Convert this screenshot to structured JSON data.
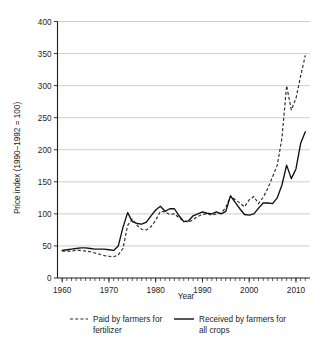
{
  "chart_data": {
    "type": "line",
    "title": "",
    "xlabel": "Year",
    "ylabel": "Price index (1990–1992 = 100)",
    "xlim": [
      1959,
      2013
    ],
    "ylim": [
      0,
      400
    ],
    "xticks": [
      1960,
      1970,
      1980,
      1990,
      2000,
      2010
    ],
    "xtick_labels": [
      "1960",
      "1970",
      "1980",
      "1990",
      "2000",
      "2010"
    ],
    "yticks": [
      0,
      50,
      100,
      150,
      200,
      250,
      300,
      350,
      400
    ],
    "ytick_labels": [
      "0",
      "50",
      "100",
      "150",
      "200",
      "250",
      "300",
      "350",
      "400"
    ],
    "minor_x_tick_interval": 1,
    "grid": "horizontal",
    "legend_position": "below-axes",
    "series": [
      {
        "name": "Paid by farmers for fertilizer",
        "style": "dashed",
        "color": "#2b2b2b",
        "x": [
          1960,
          1961,
          1962,
          1963,
          1964,
          1965,
          1966,
          1967,
          1968,
          1969,
          1970,
          1971,
          1972,
          1973,
          1974,
          1975,
          1976,
          1977,
          1978,
          1979,
          1980,
          1981,
          1982,
          1983,
          1984,
          1985,
          1986,
          1987,
          1988,
          1989,
          1990,
          1991,
          1992,
          1993,
          1994,
          1995,
          1996,
          1997,
          1998,
          1999,
          2000,
          2001,
          2002,
          2003,
          2004,
          2005,
          2006,
          2007,
          2008,
          2009,
          2010,
          2011,
          2012
        ],
        "values": [
          42,
          42,
          42,
          43,
          43,
          42,
          41,
          39,
          37,
          35,
          34,
          33,
          36,
          46,
          82,
          92,
          82,
          76,
          75,
          80,
          90,
          104,
          103,
          99,
          100,
          94,
          89,
          87,
          91,
          96,
          99,
          100,
          98,
          100,
          101,
          110,
          128,
          122,
          117,
          111,
          122,
          127,
          116,
          126,
          140,
          158,
          176,
          218,
          300,
          262,
          280,
          315,
          347
        ]
      },
      {
        "name": "Received by farmers for all crops",
        "style": "solid",
        "color": "#111111",
        "x": [
          1960,
          1961,
          1962,
          1963,
          1964,
          1965,
          1966,
          1967,
          1968,
          1969,
          1970,
          1971,
          1972,
          1973,
          1974,
          1975,
          1976,
          1977,
          1978,
          1979,
          1980,
          1981,
          1982,
          1983,
          1984,
          1985,
          1986,
          1987,
          1988,
          1989,
          1990,
          1991,
          1992,
          1993,
          1994,
          1995,
          1996,
          1997,
          1998,
          1999,
          2000,
          2001,
          2002,
          2003,
          2004,
          2005,
          2006,
          2007,
          2008,
          2009,
          2010,
          2011,
          2012
        ],
        "values": [
          43,
          44,
          45,
          46,
          47,
          47,
          46,
          45,
          45,
          45,
          44,
          43,
          50,
          79,
          102,
          88,
          85,
          84,
          87,
          97,
          106,
          112,
          104,
          108,
          108,
          97,
          88,
          89,
          97,
          100,
          103,
          101,
          100,
          103,
          100,
          104,
          128,
          118,
          108,
          99,
          98,
          100,
          109,
          117,
          117,
          116,
          125,
          145,
          176,
          155,
          170,
          210,
          228
        ]
      }
    ],
    "legend": [
      {
        "label_line1": "Paid by farmers for",
        "label_line2": "fertilizer",
        "style": "dashed"
      },
      {
        "label_line1": "Received by farmers for",
        "label_line2": "all crops",
        "style": "solid"
      }
    ]
  },
  "colors": {
    "background": "#ffffff",
    "grid": "#b9b9b9",
    "axis": "#1d1d1d",
    "series_solid": "#111111",
    "series_dashed": "#2b2b2b"
  }
}
